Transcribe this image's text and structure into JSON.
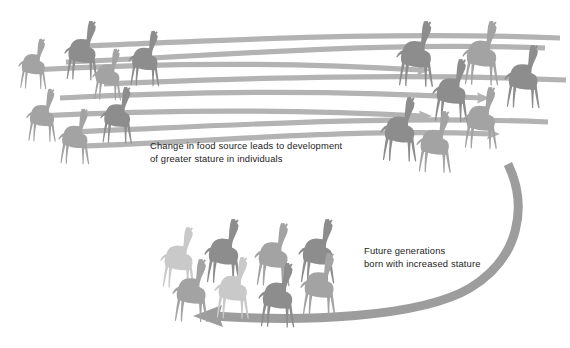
{
  "figure": {
    "background_color": "#ffffff",
    "captions": [
      {
        "id": "caption-change-food-source",
        "line1": "Change in food source leads to development",
        "line2": "of greater stature in individuals",
        "x": 150,
        "y": 149,
        "color": "#1c1c22"
      },
      {
        "id": "caption-future-generations",
        "line1": "Future generations",
        "line2": "born with increased stature",
        "x": 364,
        "y": 254,
        "color": "#1c1c22"
      }
    ],
    "colors": {
      "giraffe_dark": "#8d8d8d",
      "giraffe_mid": "#a3a3a3",
      "giraffe_light": "#b9b9b9",
      "giraffe_pale": "#c9c9c9",
      "arrow_straight": "#b3b3b3",
      "arrow_curved": "#9d9d9d",
      "text": "#1c1c22"
    },
    "groups": [
      {
        "id": "group-original-population",
        "label": "original shorter giraffes",
        "count": 8,
        "region": "top-left",
        "giraffes": [
          {
            "x": 18,
            "y": 38,
            "scale": 0.78,
            "shade": "giraffe_mid"
          },
          {
            "x": 64,
            "y": 20,
            "scale": 0.92,
            "shade": "giraffe_dark"
          },
          {
            "x": 92,
            "y": 48,
            "scale": 0.8,
            "shade": "giraffe_mid"
          },
          {
            "x": 128,
            "y": 30,
            "scale": 0.86,
            "shade": "giraffe_dark"
          },
          {
            "x": 26,
            "y": 88,
            "scale": 0.82,
            "shade": "giraffe_mid"
          },
          {
            "x": 58,
            "y": 108,
            "scale": 0.86,
            "shade": "giraffe_mid"
          },
          {
            "x": 100,
            "y": 86,
            "scale": 0.88,
            "shade": "giraffe_dark"
          },
          {
            "x": 0,
            "y": 0,
            "scale": 0,
            "shade": "giraffe_mid"
          }
        ]
      },
      {
        "id": "group-stretched-population",
        "label": "giraffes with stretched necks",
        "count": 8,
        "region": "top-right",
        "giraffes": [
          {
            "x": 396,
            "y": 20,
            "scale": 1.02,
            "shade": "giraffe_dark"
          },
          {
            "x": 432,
            "y": 58,
            "scale": 0.98,
            "shade": "giraffe_dark"
          },
          {
            "x": 462,
            "y": 20,
            "scale": 1.0,
            "shade": "giraffe_mid"
          },
          {
            "x": 504,
            "y": 44,
            "scale": 0.98,
            "shade": "giraffe_dark"
          },
          {
            "x": 380,
            "y": 96,
            "scale": 1.0,
            "shade": "giraffe_dark"
          },
          {
            "x": 416,
            "y": 110,
            "scale": 0.96,
            "shade": "giraffe_mid"
          },
          {
            "x": 462,
            "y": 86,
            "scale": 0.96,
            "shade": "giraffe_mid"
          },
          {
            "x": 0,
            "y": 0,
            "scale": 0,
            "shade": "giraffe_mid"
          }
        ]
      },
      {
        "id": "group-next-generation",
        "label": "future generations born tall",
        "count": 8,
        "region": "bottom",
        "giraffes": [
          {
            "x": 160,
            "y": 226,
            "scale": 0.95,
            "shade": "giraffe_pale"
          },
          {
            "x": 204,
            "y": 218,
            "scale": 1.0,
            "shade": "giraffe_dark"
          },
          {
            "x": 254,
            "y": 222,
            "scale": 0.98,
            "shade": "giraffe_mid"
          },
          {
            "x": 298,
            "y": 218,
            "scale": 1.0,
            "shade": "giraffe_dark"
          },
          {
            "x": 172,
            "y": 258,
            "scale": 0.98,
            "shade": "giraffe_mid"
          },
          {
            "x": 214,
            "y": 256,
            "scale": 0.96,
            "shade": "giraffe_pale"
          },
          {
            "x": 258,
            "y": 262,
            "scale": 1.0,
            "shade": "giraffe_dark"
          },
          {
            "x": 300,
            "y": 252,
            "scale": 0.98,
            "shade": "giraffe_mid"
          }
        ]
      }
    ],
    "arrows": {
      "straight_flow": {
        "id": "straight-flow-arrows",
        "label": "flow arrows from short to tall giraffes",
        "count": 8,
        "direction": "left-to-right",
        "color": "#b3b3b3",
        "thickness": 5.2
      },
      "curved_feedback": {
        "id": "curved-generation-arrow",
        "label": "curved arrow to next generation",
        "direction": "right-to-left",
        "color": "#9d9d9d",
        "start": [
          508,
          164
        ],
        "end": [
          196,
          316
        ]
      }
    }
  }
}
